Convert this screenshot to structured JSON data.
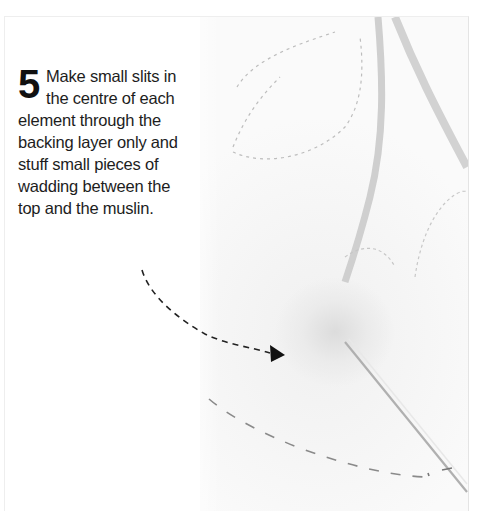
{
  "instruction": {
    "step_number": "5",
    "text": "Make small slits in the centre of each element through the backing layer only and stuff small pieces of wadding between the top and the muslin."
  },
  "illustration": {
    "subject": "quilted fabric with puffed element, stuffed with wadding, needle inserted",
    "annotations": [
      "dashed-arrow-pointer",
      "dashed-stitch-line"
    ]
  },
  "colors": {
    "text": "#1d1d1d",
    "arrow": "#222222",
    "fabric": "#f5f5f5",
    "stitches": "#a8a8a8"
  }
}
